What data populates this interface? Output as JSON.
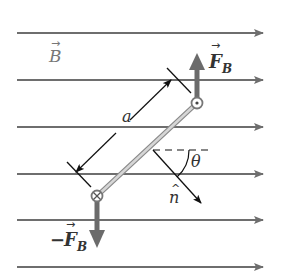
{
  "diagram": {
    "field_label": "B",
    "force_label": "F",
    "force_subscript": "B",
    "neg_force_prefix": "−",
    "length_label": "a",
    "angle_label": "θ",
    "normal_label": "n",
    "normal_hat": "^",
    "vector_arrow": "→",
    "field_lines_y": [
      33,
      80,
      127,
      174,
      220,
      267
    ],
    "colors": {
      "field_line": "#6e6e6e",
      "force_arrow": "#6b6b6b",
      "wire": "#b5b5b5",
      "text": "#333333"
    }
  }
}
